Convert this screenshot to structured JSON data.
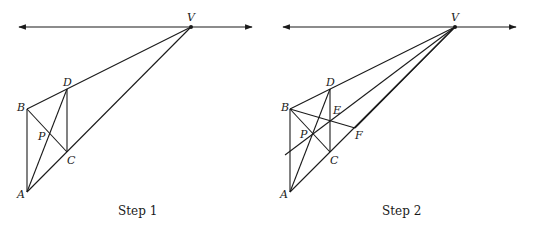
{
  "figures": [
    {
      "caption": "Step 1",
      "labels": {
        "V": "V",
        "B": "B",
        "D": "D",
        "P": "P",
        "C": "C",
        "A": "A"
      }
    },
    {
      "caption": "Step 2",
      "labels": {
        "V": "V",
        "B": "B",
        "D": "D",
        "E": "E",
        "P": "P",
        "F": "F",
        "C": "C",
        "A": "A"
      }
    }
  ],
  "colors": {
    "line": "#1a1a1a",
    "background": "#ffffff"
  }
}
